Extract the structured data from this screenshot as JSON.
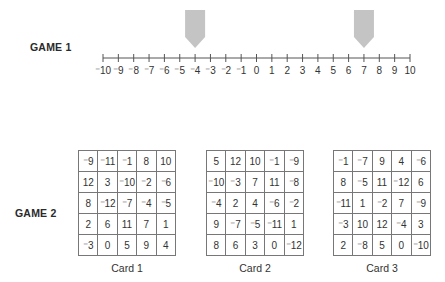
{
  "game1": {
    "label": "GAME 1",
    "number_line": {
      "min": -10,
      "max": 10,
      "tick_labels": [
        "⁻10",
        "⁻9",
        "⁻8",
        "⁻7",
        "⁻6",
        "⁻5",
        "⁻4",
        "⁻3",
        "⁻2",
        "⁻1",
        "0",
        "1",
        "2",
        "3",
        "4",
        "5",
        "6",
        "7",
        "8",
        "9",
        "10"
      ]
    },
    "markers": [
      {
        "value": -4
      },
      {
        "value": 7
      }
    ],
    "marker_color": "#c4c4c4"
  },
  "game2": {
    "label": "GAME 2",
    "cards": [
      {
        "caption": "Card 1",
        "rows": [
          [
            "⁻9",
            "⁻11",
            "⁻1",
            "8",
            "10"
          ],
          [
            "12",
            "3",
            "⁻10",
            "⁻2",
            "⁻6"
          ],
          [
            "8",
            "⁻12",
            "⁻7",
            "⁻4",
            "⁻5"
          ],
          [
            "2",
            "6",
            "11",
            "7",
            "1"
          ],
          [
            "⁻3",
            "0",
            "5",
            "9",
            "4"
          ]
        ]
      },
      {
        "caption": "Card 2",
        "rows": [
          [
            "5",
            "12",
            "10",
            "⁻1",
            "⁻9"
          ],
          [
            "⁻10",
            "⁻3",
            "7",
            "11",
            "⁻8"
          ],
          [
            "⁻4",
            "2",
            "4",
            "⁻6",
            "⁻2"
          ],
          [
            "9",
            "⁻7",
            "⁻5",
            "⁻11",
            "1"
          ],
          [
            "8",
            "6",
            "3",
            "0",
            "⁻12"
          ]
        ]
      },
      {
        "caption": "Card 3",
        "rows": [
          [
            "⁻1",
            "⁻7",
            "9",
            "4",
            "⁻6"
          ],
          [
            "8",
            "⁻5",
            "11",
            "⁻12",
            "6"
          ],
          [
            "⁻11",
            "1",
            "⁻2",
            "7",
            "⁻9"
          ],
          [
            "⁻3",
            "10",
            "12",
            "⁻4",
            "3"
          ],
          [
            "2",
            "⁻8",
            "5",
            "0",
            "⁻10"
          ]
        ]
      }
    ]
  }
}
